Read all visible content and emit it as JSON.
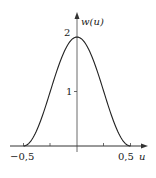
{
  "chart_data": {
    "type": "line",
    "title": "",
    "xlabel": "u",
    "ylabel": "w(u)",
    "xlim": [
      -0.5,
      0.5
    ],
    "ylim": [
      0,
      2
    ],
    "grid": false,
    "legend": null,
    "x_ticks": [
      -0.5,
      -0.25,
      0,
      0.25,
      0.5
    ],
    "x_tick_labels": [
      "-0,5",
      "",
      "",
      "",
      "0,5"
    ],
    "y_ticks": [
      1,
      2
    ],
    "y_tick_labels": [
      "1",
      "2"
    ],
    "series": [
      {
        "name": "w(u)",
        "x": [
          -0.5,
          -0.4,
          -0.3,
          -0.25,
          -0.2,
          -0.1,
          0,
          0.1,
          0.2,
          0.25,
          0.3,
          0.4,
          0.5
        ],
        "values": [
          0,
          0.19,
          0.69,
          1.0,
          1.31,
          1.81,
          2.0,
          1.81,
          1.31,
          1.0,
          0.69,
          0.19,
          0
        ]
      }
    ]
  },
  "labels": {
    "y_axis": "w(u)",
    "x_axis": "u",
    "x_min": "−0,5",
    "x_max": "0,5",
    "y_one": "1",
    "y_two": "2"
  }
}
